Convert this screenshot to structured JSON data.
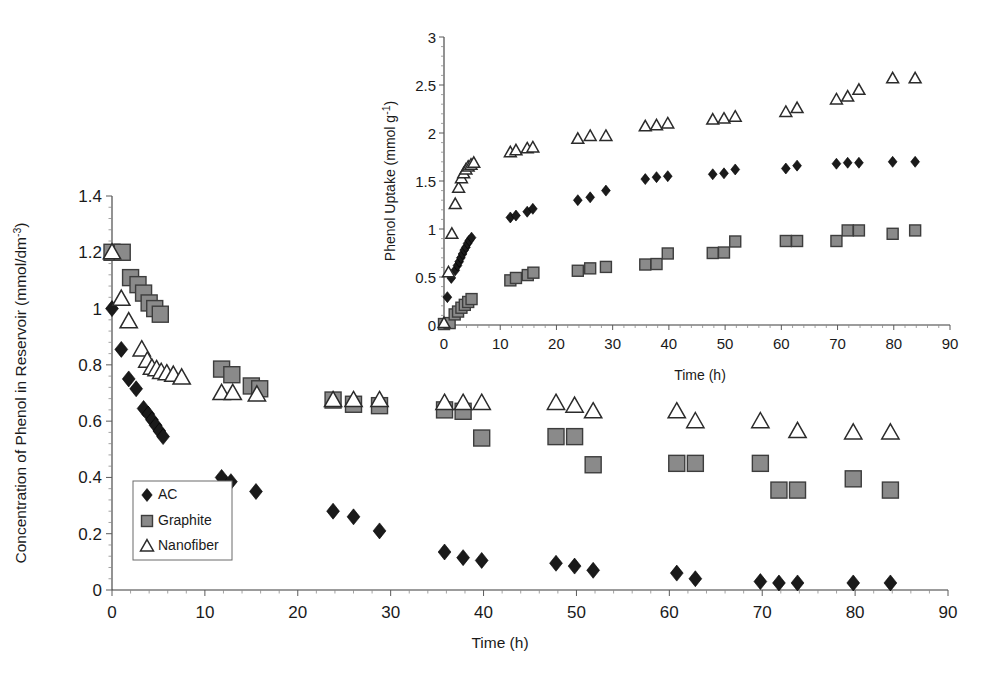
{
  "figure": {
    "title": "",
    "background": "#ffffff"
  },
  "main_axis": {
    "xlabel": "Time (h)",
    "ylabel_text": "Concentration of Phenol in Reservoir (mmol/dm",
    "ylabel_sup": "-3",
    "ylabel_tail": ")",
    "ylabel_full": "Concentration of Phenol in Reservoir (mmol/dm-3)",
    "x_ticks": [
      "0",
      "10",
      "20",
      "30",
      "40",
      "50",
      "60",
      "70",
      "80",
      "90"
    ],
    "y_ticks": [
      "0",
      "0.2",
      "0.4",
      "0.6",
      "0.8",
      "1",
      "1.2",
      "1.4"
    ],
    "xlim": [
      0,
      90
    ],
    "ylim": [
      0,
      1.4
    ]
  },
  "inset_axis": {
    "xlabel": "Time (h)",
    "ylabel_text": "Phenol Uptake (mmol g",
    "ylabel_sup": "-1",
    "ylabel_tail": ")",
    "ylabel_full": "Phenol Uptake (mmol g-1)",
    "x_ticks": [
      "0",
      "10",
      "20",
      "30",
      "40",
      "50",
      "60",
      "70",
      "80",
      "90"
    ],
    "y_ticks": [
      "0",
      "0.5",
      "1",
      "1.5",
      "2",
      "2.5",
      "3"
    ],
    "xlim": [
      0,
      90
    ],
    "ylim": [
      0,
      3
    ]
  },
  "legend": {
    "position": "lower-left-inside-main",
    "items": [
      {
        "label": "AC",
        "marker": "diamond-filled",
        "color": "#1a1a1a"
      },
      {
        "label": "Graphite",
        "marker": "square-gray",
        "color": "#8a8a8a"
      },
      {
        "label": "Nanofiber",
        "marker": "triangle-open",
        "color": "#ffffff"
      }
    ]
  },
  "colors": {
    "ac": "#1a1a1a",
    "graphite": "#8a8a8a",
    "graphite_edge": "#3d3d3d",
    "nanofiber_fill": "#ffffff",
    "nanofiber_edge": "#2b2b2b",
    "axis": "#3a3a3a",
    "text": "#1a1a1a"
  },
  "chart_data": [
    {
      "id": "main",
      "type": "scatter",
      "title": "",
      "xlabel": "Time (h)",
      "ylabel": "Concentration of Phenol in Reservoir (mmol/dm-3)",
      "xlim": [
        0,
        90
      ],
      "ylim": [
        0,
        1.4
      ],
      "xticks": [
        0,
        10,
        20,
        30,
        40,
        50,
        60,
        70,
        80,
        90
      ],
      "yticks": [
        0,
        0.2,
        0.4,
        0.6,
        0.8,
        1.0,
        1.2,
        1.4
      ],
      "grid": false,
      "legend": [
        "AC",
        "Graphite",
        "Nanofiber"
      ],
      "series": [
        {
          "name": "AC",
          "marker": "diamond-filled",
          "points": [
            [
              0.0,
              1.0
            ],
            [
              1.0,
              0.855
            ],
            [
              1.8,
              0.75
            ],
            [
              2.6,
              0.715
            ],
            [
              3.4,
              0.645
            ],
            [
              3.9,
              0.625
            ],
            [
              4.3,
              0.605
            ],
            [
              4.7,
              0.585
            ],
            [
              5.1,
              0.565
            ],
            [
              5.5,
              0.545
            ],
            [
              11.8,
              0.4
            ],
            [
              12.8,
              0.385
            ],
            [
              15.5,
              0.35
            ],
            [
              23.8,
              0.28
            ],
            [
              26.0,
              0.26
            ],
            [
              28.8,
              0.21
            ],
            [
              35.8,
              0.135
            ],
            [
              37.8,
              0.115
            ],
            [
              39.8,
              0.105
            ],
            [
              47.8,
              0.095
            ],
            [
              49.8,
              0.085
            ],
            [
              51.8,
              0.07
            ],
            [
              60.8,
              0.06
            ],
            [
              62.8,
              0.04
            ],
            [
              69.8,
              0.03
            ],
            [
              71.8,
              0.025
            ],
            [
              73.8,
              0.025
            ],
            [
              79.8,
              0.025
            ],
            [
              83.8,
              0.025
            ]
          ]
        },
        {
          "name": "Graphite",
          "marker": "square-gray",
          "points": [
            [
              0.0,
              1.2
            ],
            [
              1.1,
              1.2
            ],
            [
              2.0,
              1.11
            ],
            [
              2.8,
              1.085
            ],
            [
              3.4,
              1.055
            ],
            [
              4.0,
              1.02
            ],
            [
              4.6,
              1.0
            ],
            [
              5.2,
              0.98
            ],
            [
              11.8,
              0.785
            ],
            [
              12.9,
              0.765
            ],
            [
              15.0,
              0.725
            ],
            [
              15.9,
              0.715
            ],
            [
              23.8,
              0.675
            ],
            [
              26.0,
              0.66
            ],
            [
              28.8,
              0.655
            ],
            [
              35.8,
              0.64
            ],
            [
              37.8,
              0.635
            ],
            [
              39.8,
              0.54
            ],
            [
              47.8,
              0.545
            ],
            [
              49.8,
              0.545
            ],
            [
              51.8,
              0.445
            ],
            [
              60.8,
              0.45
            ],
            [
              62.8,
              0.45
            ],
            [
              69.8,
              0.45
            ],
            [
              71.8,
              0.355
            ],
            [
              73.8,
              0.355
            ],
            [
              79.8,
              0.395
            ],
            [
              83.8,
              0.355
            ]
          ]
        },
        {
          "name": "Nanofiber",
          "marker": "triangle-open",
          "points": [
            [
              0.0,
              1.2
            ],
            [
              1.0,
              1.035
            ],
            [
              1.8,
              0.955
            ],
            [
              3.2,
              0.855
            ],
            [
              3.8,
              0.815
            ],
            [
              4.3,
              0.79
            ],
            [
              4.8,
              0.785
            ],
            [
              5.3,
              0.775
            ],
            [
              5.9,
              0.77
            ],
            [
              6.6,
              0.765
            ],
            [
              7.5,
              0.755
            ],
            [
              11.8,
              0.7
            ],
            [
              13.0,
              0.7
            ],
            [
              15.6,
              0.695
            ],
            [
              23.8,
              0.675
            ],
            [
              26.0,
              0.675
            ],
            [
              28.8,
              0.675
            ],
            [
              35.8,
              0.665
            ],
            [
              37.8,
              0.665
            ],
            [
              39.8,
              0.665
            ],
            [
              47.8,
              0.665
            ],
            [
              49.8,
              0.655
            ],
            [
              51.8,
              0.635
            ],
            [
              60.8,
              0.635
            ],
            [
              62.8,
              0.6
            ],
            [
              69.8,
              0.6
            ],
            [
              73.8,
              0.565
            ],
            [
              79.8,
              0.56
            ],
            [
              83.8,
              0.56
            ]
          ]
        }
      ]
    },
    {
      "id": "inset",
      "type": "scatter",
      "title": "",
      "xlabel": "Time (h)",
      "ylabel": "Phenol Uptake (mmol g-1)",
      "xlim": [
        0,
        90
      ],
      "ylim": [
        0,
        3
      ],
      "xticks": [
        0,
        10,
        20,
        30,
        40,
        50,
        60,
        70,
        80,
        90
      ],
      "yticks": [
        0,
        0.5,
        1.0,
        1.5,
        2.0,
        2.5,
        3.0
      ],
      "grid": false,
      "legend": [
        "AC",
        "Graphite",
        "Nanofiber"
      ],
      "series": [
        {
          "name": "AC",
          "marker": "diamond-filled",
          "points": [
            [
              0.0,
              0.02
            ],
            [
              0.6,
              0.29
            ],
            [
              1.3,
              0.49
            ],
            [
              2.0,
              0.57
            ],
            [
              2.4,
              0.62
            ],
            [
              2.7,
              0.66
            ],
            [
              3.0,
              0.7
            ],
            [
              3.3,
              0.74
            ],
            [
              3.6,
              0.78
            ],
            [
              3.9,
              0.81
            ],
            [
              4.2,
              0.85
            ],
            [
              4.5,
              0.88
            ],
            [
              4.9,
              0.91
            ],
            [
              11.8,
              1.12
            ],
            [
              12.8,
              1.14
            ],
            [
              14.8,
              1.18
            ],
            [
              15.8,
              1.21
            ],
            [
              23.8,
              1.3
            ],
            [
              26.0,
              1.33
            ],
            [
              28.8,
              1.4
            ],
            [
              35.8,
              1.52
            ],
            [
              37.8,
              1.54
            ],
            [
              39.8,
              1.55
            ],
            [
              47.8,
              1.57
            ],
            [
              49.8,
              1.58
            ],
            [
              51.8,
              1.62
            ],
            [
              60.8,
              1.63
            ],
            [
              62.8,
              1.66
            ],
            [
              69.8,
              1.68
            ],
            [
              71.8,
              1.69
            ],
            [
              73.8,
              1.69
            ],
            [
              79.8,
              1.7
            ],
            [
              83.8,
              1.7
            ]
          ]
        },
        {
          "name": "Graphite",
          "marker": "square-gray",
          "points": [
            [
              0.0,
              0.01
            ],
            [
              1.0,
              0.02
            ],
            [
              1.9,
              0.11
            ],
            [
              2.5,
              0.14
            ],
            [
              3.1,
              0.18
            ],
            [
              3.7,
              0.21
            ],
            [
              4.3,
              0.24
            ],
            [
              4.9,
              0.27
            ],
            [
              11.8,
              0.465
            ],
            [
              12.8,
              0.49
            ],
            [
              14.9,
              0.52
            ],
            [
              15.9,
              0.545
            ],
            [
              23.8,
              0.565
            ],
            [
              26.0,
              0.59
            ],
            [
              28.8,
              0.605
            ],
            [
              35.8,
              0.63
            ],
            [
              37.8,
              0.635
            ],
            [
              39.8,
              0.745
            ],
            [
              47.8,
              0.75
            ],
            [
              49.8,
              0.755
            ],
            [
              51.8,
              0.87
            ],
            [
              60.8,
              0.875
            ],
            [
              62.8,
              0.875
            ],
            [
              69.8,
              0.875
            ],
            [
              71.8,
              0.985
            ],
            [
              73.8,
              0.985
            ],
            [
              79.8,
              0.95
            ],
            [
              83.8,
              0.985
            ]
          ]
        },
        {
          "name": "Nanofiber",
          "marker": "triangle-open",
          "points": [
            [
              0.0,
              0.02
            ],
            [
              0.8,
              0.55
            ],
            [
              1.4,
              0.95
            ],
            [
              2.0,
              1.26
            ],
            [
              2.6,
              1.43
            ],
            [
              3.1,
              1.53
            ],
            [
              3.5,
              1.58
            ],
            [
              3.9,
              1.62
            ],
            [
              4.3,
              1.65
            ],
            [
              4.8,
              1.67
            ],
            [
              5.3,
              1.69
            ],
            [
              11.8,
              1.8
            ],
            [
              12.8,
              1.82
            ],
            [
              14.8,
              1.84
            ],
            [
              15.8,
              1.85
            ],
            [
              23.8,
              1.94
            ],
            [
              26.0,
              1.97
            ],
            [
              28.8,
              1.97
            ],
            [
              35.8,
              2.07
            ],
            [
              37.8,
              2.08
            ],
            [
              39.8,
              2.1
            ],
            [
              47.8,
              2.14
            ],
            [
              49.8,
              2.15
            ],
            [
              51.8,
              2.17
            ],
            [
              60.8,
              2.22
            ],
            [
              62.8,
              2.26
            ],
            [
              69.8,
              2.35
            ],
            [
              71.8,
              2.38
            ],
            [
              73.8,
              2.45
            ],
            [
              79.8,
              2.57
            ],
            [
              83.8,
              2.57
            ]
          ]
        }
      ]
    }
  ]
}
